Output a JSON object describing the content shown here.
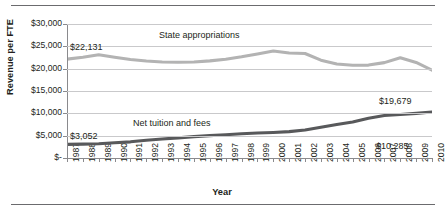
{
  "chart_data": {
    "type": "line",
    "title": "",
    "xlabel": "Year",
    "ylabel": "Revenue per FTE",
    "grid": true,
    "legend_position": "inline-annotations",
    "xlim": [
      1987,
      2010
    ],
    "ylim": [
      0,
      30000
    ],
    "ytick_labels": [
      "$30,000",
      "$25,000",
      "$20,000",
      "$15,000",
      "$10,000",
      "$5,000",
      "$-"
    ],
    "ytick_values": [
      30000,
      25000,
      20000,
      15000,
      10000,
      5000,
      0
    ],
    "categories": [
      "1987",
      "1988",
      "1989",
      "1990",
      "1991",
      "1992",
      "1993",
      "1994",
      "1995",
      "1996",
      "1997",
      "1998",
      "1999",
      "2000",
      "2001",
      "2002",
      "2003",
      "2004",
      "2005",
      "2006",
      "2007",
      "2008",
      "2009",
      "2010"
    ],
    "series": [
      {
        "name": "State appropriations",
        "color": "#b3b3b3",
        "values": [
          22131,
          22550,
          23100,
          22550,
          22050,
          21700,
          21500,
          21450,
          21500,
          21750,
          22100,
          22650,
          23300,
          23950,
          23500,
          23400,
          21900,
          21050,
          20750,
          20800,
          21350,
          22450,
          21400,
          19679
        ],
        "start_label": "$22,131",
        "end_label": "$19,679"
      },
      {
        "name": "Net tuition and fees",
        "color": "#58595b",
        "values": [
          3052,
          3100,
          3180,
          3400,
          3620,
          3980,
          4250,
          4500,
          4780,
          5000,
          5200,
          5420,
          5600,
          5720,
          5900,
          6250,
          6900,
          7500,
          8050,
          8900,
          9500,
          9750,
          10000,
          10285
        ],
        "start_label": "$3,052",
        "end_label": "$10,285"
      }
    ],
    "annotations": [
      {
        "text": "State appropriations",
        "x": 1992.6,
        "y": 27600
      },
      {
        "text": "Net tuition and fees",
        "x": 1993.2,
        "y": 8000
      },
      {
        "text": "$22,131",
        "x": 1986.4,
        "y": 25000
      },
      {
        "text": "$19,679",
        "x": 2007.2,
        "y": 17900
      },
      {
        "text": "$3,052",
        "x": 1986.5,
        "y": 5000
      },
      {
        "text": "$10,285",
        "x": 2007.4,
        "y": 8600
      }
    ]
  },
  "axis_titles": {
    "y": "Revenue per FTE",
    "x": "Year"
  },
  "annotation_labels": {
    "state_appropriations": "State appropriations",
    "net_tuition_and_fees": "Net tuition and fees",
    "state_start": "$22,131",
    "state_end": "$19,679",
    "tuition_start": "$3,052",
    "tuition_end": "$10,285"
  },
  "colors": {
    "state_line": "#b3b3b3",
    "tuition_line": "#58595b",
    "gridline": "#c9c9cb",
    "axis": "#8a8a8d",
    "rule": "#6b6b6e",
    "text": "#231f20"
  }
}
